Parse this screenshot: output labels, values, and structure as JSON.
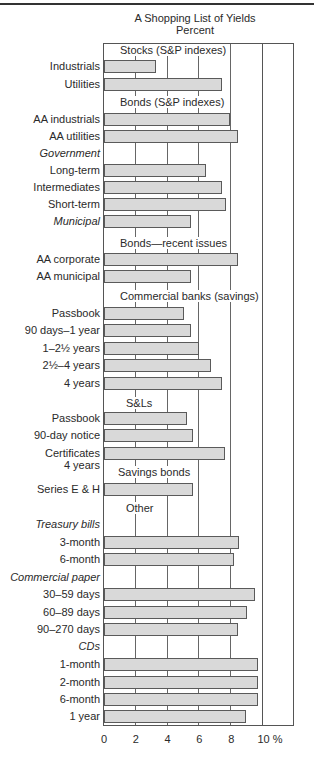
{
  "page": {
    "title": "A Shopping List of Yields",
    "subtitle": "Percent"
  },
  "axis": {
    "ticks": [
      "0",
      "2",
      "4",
      "6",
      "8",
      "10 %"
    ],
    "tick_values": [
      0,
      2,
      4,
      6,
      8,
      10
    ],
    "max": 12
  },
  "rows": [
    {
      "type": "section",
      "label": "Stocks (S&P indexes)",
      "y": 50
    },
    {
      "type": "bar",
      "label": "Industrials",
      "value": 3.3,
      "y": 66
    },
    {
      "type": "bar",
      "label": "Utilities",
      "value": 7.4,
      "y": 84
    },
    {
      "type": "section",
      "label": "Bonds (S&P indexes)",
      "y": 102
    },
    {
      "type": "bar",
      "label": "AA industrials",
      "value": 7.9,
      "y": 119
    },
    {
      "type": "bar",
      "label": "AA utilities",
      "value": 8.4,
      "y": 136
    },
    {
      "type": "subheader",
      "label": "Government",
      "y": 153
    },
    {
      "type": "bar",
      "label": "Long-term",
      "value": 6.4,
      "y": 170
    },
    {
      "type": "bar",
      "label": "Intermediates",
      "value": 7.4,
      "y": 187
    },
    {
      "type": "bar",
      "label": "Short-term",
      "value": 7.7,
      "y": 204
    },
    {
      "type": "bar",
      "label": "Municipal",
      "value": 5.5,
      "y": 221,
      "italic": true
    },
    {
      "type": "section",
      "label": "Bonds—recent issues",
      "y": 243
    },
    {
      "type": "bar",
      "label": "AA corporate",
      "value": 8.4,
      "y": 259
    },
    {
      "type": "bar",
      "label": "AA municipal",
      "value": 5.5,
      "y": 276
    },
    {
      "type": "section",
      "label": "Commercial banks (savings)",
      "y": 296
    },
    {
      "type": "bar",
      "label": "Passbook",
      "value": 5.0,
      "y": 313
    },
    {
      "type": "bar",
      "label": "90 days–1 year",
      "value": 5.5,
      "y": 330
    },
    {
      "type": "bar",
      "label": "1–2½ years",
      "value": 6.0,
      "y": 348
    },
    {
      "type": "bar",
      "label": "2½–4 years",
      "value": 6.7,
      "y": 365
    },
    {
      "type": "bar",
      "label": "4 years",
      "value": 7.4,
      "y": 383
    },
    {
      "type": "section",
      "label": "S&Ls",
      "y": 403
    },
    {
      "type": "bar",
      "label": "Passbook",
      "value": 5.25,
      "y": 418
    },
    {
      "type": "bar",
      "label": "90-day notice",
      "value": 5.6,
      "y": 435
    },
    {
      "type": "bar",
      "label": "Certificates",
      "label2": "4 years",
      "value": 7.6,
      "y": 453
    },
    {
      "type": "section",
      "label": "Savings bonds",
      "y": 472
    },
    {
      "type": "bar",
      "label": "Series E & H",
      "value": 5.6,
      "y": 489
    },
    {
      "type": "section",
      "label": "Other",
      "y": 508
    },
    {
      "type": "subheader",
      "label": "Treasury bills",
      "y": 524
    },
    {
      "type": "bar",
      "label": "3-month",
      "value": 8.5,
      "y": 542
    },
    {
      "type": "bar",
      "label": "6-month",
      "value": 8.2,
      "y": 559
    },
    {
      "type": "subheader",
      "label": "Commercial paper",
      "y": 577
    },
    {
      "type": "bar",
      "label": "30–59 days",
      "value": 9.5,
      "y": 594
    },
    {
      "type": "bar",
      "label": "60–89 days",
      "value": 9.0,
      "y": 612
    },
    {
      "type": "bar",
      "label": "90–270 days",
      "value": 8.4,
      "y": 629
    },
    {
      "type": "subheader",
      "label": "CDs",
      "y": 646
    },
    {
      "type": "bar",
      "label": "1-month",
      "value": 9.7,
      "y": 664
    },
    {
      "type": "bar",
      "label": "2-month",
      "value": 9.7,
      "y": 682
    },
    {
      "type": "bar",
      "label": "6-month",
      "value": 9.7,
      "y": 699
    },
    {
      "type": "bar",
      "label": "1 year",
      "value": 8.9,
      "y": 716
    }
  ],
  "chart_data": {
    "type": "bar",
    "orientation": "horizontal",
    "title": "A Shopping List of Yields",
    "subtitle": "Percent",
    "xlabel": "%",
    "ylabel": "",
    "xlim": [
      0,
      12
    ],
    "x_ticks": [
      0,
      2,
      4,
      6,
      8,
      10
    ],
    "grid": true,
    "groups": [
      {
        "name": "Stocks (S&P indexes)",
        "categories": [
          "Industrials",
          "Utilities"
        ],
        "values": [
          3.3,
          7.4
        ]
      },
      {
        "name": "Bonds (S&P indexes)",
        "categories": [
          "AA industrials",
          "AA utilities"
        ],
        "values": [
          7.9,
          8.4
        ]
      },
      {
        "name": "Bonds (S&P indexes) — Government",
        "categories": [
          "Long-term",
          "Intermediates",
          "Short-term"
        ],
        "values": [
          6.4,
          7.4,
          7.7
        ]
      },
      {
        "name": "Bonds (S&P indexes) — Municipal",
        "categories": [
          "Municipal"
        ],
        "values": [
          5.5
        ]
      },
      {
        "name": "Bonds—recent issues",
        "categories": [
          "AA corporate",
          "AA municipal"
        ],
        "values": [
          8.4,
          5.5
        ]
      },
      {
        "name": "Commercial banks (savings)",
        "categories": [
          "Passbook",
          "90 days–1 year",
          "1–2½ years",
          "2½–4 years",
          "4 years"
        ],
        "values": [
          5.0,
          5.5,
          6.0,
          6.7,
          7.4
        ]
      },
      {
        "name": "S&Ls",
        "categories": [
          "Passbook",
          "90-day notice",
          "Certificates 4 years"
        ],
        "values": [
          5.25,
          5.6,
          7.6
        ]
      },
      {
        "name": "Savings bonds",
        "categories": [
          "Series E & H"
        ],
        "values": [
          5.6
        ]
      },
      {
        "name": "Other — Treasury bills",
        "categories": [
          "3-month",
          "6-month"
        ],
        "values": [
          8.5,
          8.2
        ]
      },
      {
        "name": "Other — Commercial paper",
        "categories": [
          "30–59 days",
          "60–89 days",
          "90–270 days"
        ],
        "values": [
          9.5,
          9.0,
          8.4
        ]
      },
      {
        "name": "Other — CDs",
        "categories": [
          "1-month",
          "2-month",
          "6-month",
          "1 year"
        ],
        "values": [
          9.7,
          9.7,
          9.7,
          8.9
        ]
      }
    ]
  }
}
